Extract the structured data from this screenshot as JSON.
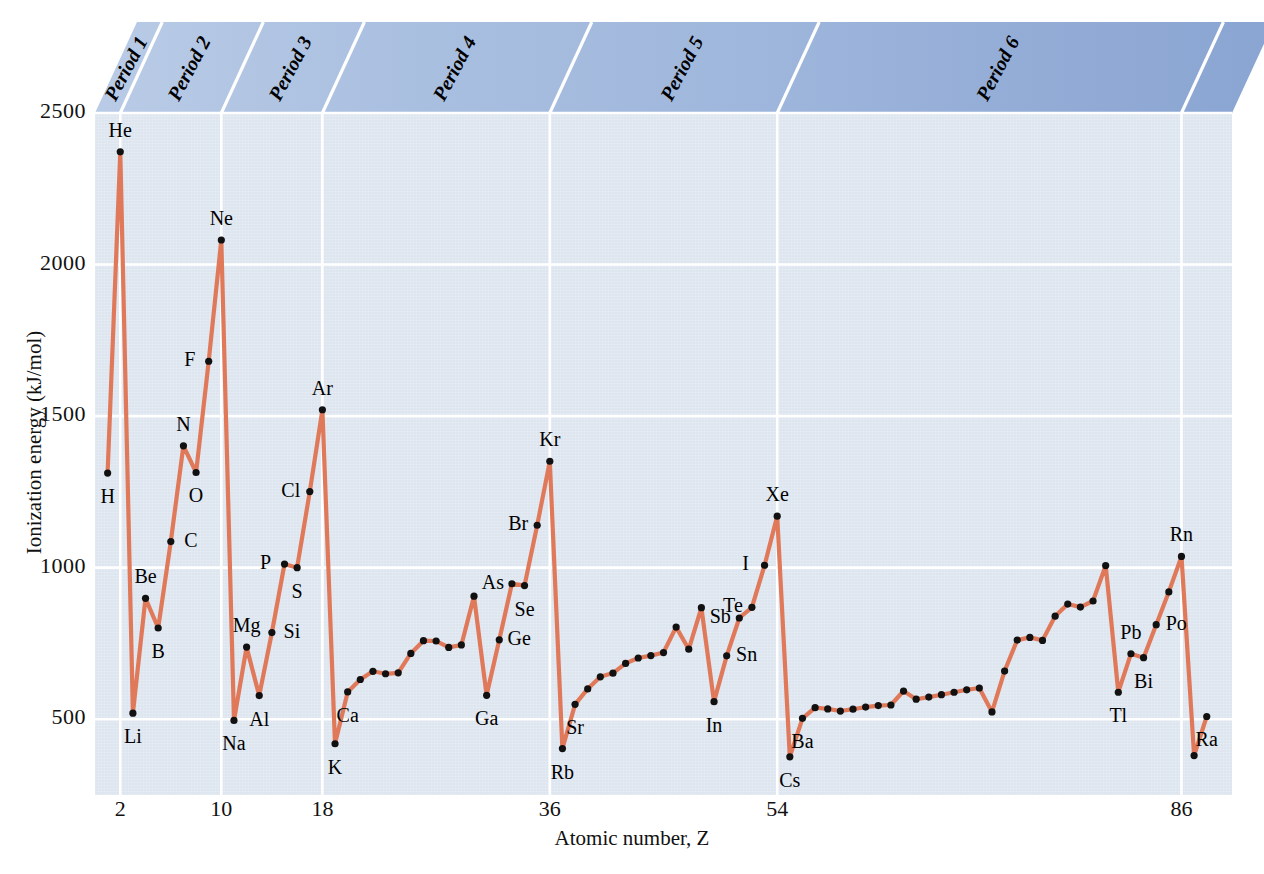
{
  "figure": {
    "axis_title_x": "Atomic number, Z",
    "axis_title_y": "Ionization energy (kJ/mol)"
  },
  "periods": [
    {
      "label": "Period 1",
      "z_start": 1,
      "z_end": 2
    },
    {
      "label": "Period 2",
      "z_start": 3,
      "z_end": 10
    },
    {
      "label": "Period 3",
      "z_start": 11,
      "z_end": 18
    },
    {
      "label": "Period 4",
      "z_start": 19,
      "z_end": 36
    },
    {
      "label": "Period 5",
      "z_start": 37,
      "z_end": 54
    },
    {
      "label": "Period 6",
      "z_start": 55,
      "z_end": 86
    }
  ],
  "colors": {
    "line": "#e0795a",
    "marker": "#111111",
    "plot_background": "#dde5ef",
    "gridline": "#ffffff",
    "band_light": "#aec3e0",
    "band_dark": "#8aa8d0"
  },
  "chart_data": {
    "type": "line",
    "title": "",
    "xlabel": "Atomic number, Z",
    "ylabel": "Ionization energy (kJ/mol)",
    "xlim": [
      0,
      90
    ],
    "ylim": [
      250,
      2500
    ],
    "xticks": [
      2,
      10,
      18,
      36,
      54,
      86
    ],
    "yticks": [
      500,
      1000,
      1500,
      2000,
      2500
    ],
    "grid": true,
    "legend": "none",
    "x": [
      1,
      2,
      3,
      4,
      5,
      6,
      7,
      8,
      9,
      10,
      11,
      12,
      13,
      14,
      15,
      16,
      17,
      18,
      19,
      20,
      21,
      22,
      23,
      24,
      25,
      26,
      27,
      28,
      29,
      30,
      31,
      32,
      33,
      34,
      35,
      36,
      37,
      38,
      39,
      40,
      41,
      42,
      43,
      44,
      45,
      46,
      47,
      48,
      49,
      50,
      51,
      52,
      53,
      54,
      55,
      56,
      57,
      58,
      59,
      60,
      61,
      62,
      63,
      64,
      65,
      66,
      67,
      68,
      69,
      70,
      71,
      72,
      73,
      74,
      75,
      76,
      77,
      78,
      79,
      80,
      81,
      82,
      83,
      84,
      85,
      86,
      87,
      88
    ],
    "values": [
      1312,
      2372,
      520,
      899,
      801,
      1086,
      1402,
      1314,
      1681,
      2081,
      496,
      738,
      578,
      786,
      1012,
      1000,
      1251,
      1521,
      419,
      590,
      631,
      658,
      650,
      653,
      717,
      759,
      758,
      737,
      745,
      906,
      579,
      762,
      947,
      941,
      1140,
      1351,
      403,
      549,
      600,
      640,
      652,
      684,
      702,
      710,
      720,
      804,
      731,
      868,
      558,
      709,
      834,
      869,
      1008,
      1170,
      376,
      503,
      538,
      534,
      527,
      533,
      540,
      545,
      547,
      593,
      566,
      573,
      581,
      589,
      597,
      603,
      524,
      659,
      761,
      770,
      760,
      840,
      880,
      870,
      890,
      1007,
      589,
      716,
      703,
      812,
      920,
      1037,
      380,
      509
    ],
    "labeled_points": [
      {
        "z": 1,
        "label": "H",
        "value": 1312,
        "pos": "below"
      },
      {
        "z": 2,
        "label": "He",
        "value": 2372,
        "pos": "above"
      },
      {
        "z": 3,
        "label": "Li",
        "value": 520,
        "pos": "below"
      },
      {
        "z": 4,
        "label": "Be",
        "value": 899,
        "pos": "above"
      },
      {
        "z": 5,
        "label": "B",
        "value": 801,
        "pos": "below"
      },
      {
        "z": 6,
        "label": "C",
        "value": 1086,
        "pos": "right"
      },
      {
        "z": 7,
        "label": "N",
        "value": 1402,
        "pos": "above"
      },
      {
        "z": 8,
        "label": "O",
        "value": 1314,
        "pos": "below"
      },
      {
        "z": 9,
        "label": "F",
        "value": 1681,
        "pos": "left"
      },
      {
        "z": 10,
        "label": "Ne",
        "value": 2081,
        "pos": "above"
      },
      {
        "z": 11,
        "label": "Na",
        "value": 496,
        "pos": "below"
      },
      {
        "z": 12,
        "label": "Mg",
        "value": 738,
        "pos": "above"
      },
      {
        "z": 13,
        "label": "Al",
        "value": 578,
        "pos": "below"
      },
      {
        "z": 14,
        "label": "Si",
        "value": 786,
        "pos": "right"
      },
      {
        "z": 15,
        "label": "P",
        "value": 1012,
        "pos": "left"
      },
      {
        "z": 16,
        "label": "S",
        "value": 1000,
        "pos": "below"
      },
      {
        "z": 17,
        "label": "Cl",
        "value": 1251,
        "pos": "left"
      },
      {
        "z": 18,
        "label": "Ar",
        "value": 1521,
        "pos": "above"
      },
      {
        "z": 19,
        "label": "K",
        "value": 419,
        "pos": "below"
      },
      {
        "z": 20,
        "label": "Ca",
        "value": 590,
        "pos": "below"
      },
      {
        "z": 31,
        "label": "Ga",
        "value": 579,
        "pos": "below"
      },
      {
        "z": 32,
        "label": "Ge",
        "value": 762,
        "pos": "right"
      },
      {
        "z": 33,
        "label": "As",
        "value": 947,
        "pos": "left"
      },
      {
        "z": 34,
        "label": "Se",
        "value": 941,
        "pos": "below"
      },
      {
        "z": 35,
        "label": "Br",
        "value": 1140,
        "pos": "left"
      },
      {
        "z": 36,
        "label": "Kr",
        "value": 1351,
        "pos": "above"
      },
      {
        "z": 37,
        "label": "Rb",
        "value": 403,
        "pos": "below"
      },
      {
        "z": 38,
        "label": "Sr",
        "value": 549,
        "pos": "below"
      },
      {
        "z": 49,
        "label": "In",
        "value": 558,
        "pos": "below"
      },
      {
        "z": 50,
        "label": "Sn",
        "value": 709,
        "pos": "right"
      },
      {
        "z": 51,
        "label": "Sb",
        "value": 834,
        "pos": "left"
      },
      {
        "z": 52,
        "label": "Te",
        "value": 869,
        "pos": "left"
      },
      {
        "z": 53,
        "label": "I",
        "value": 1008,
        "pos": "left"
      },
      {
        "z": 54,
        "label": "Xe",
        "value": 1170,
        "pos": "above"
      },
      {
        "z": 55,
        "label": "Cs",
        "value": 376,
        "pos": "below"
      },
      {
        "z": 56,
        "label": "Ba",
        "value": 503,
        "pos": "below"
      },
      {
        "z": 81,
        "label": "Tl",
        "value": 589,
        "pos": "below"
      },
      {
        "z": 82,
        "label": "Pb",
        "value": 716,
        "pos": "above"
      },
      {
        "z": 83,
        "label": "Bi",
        "value": 703,
        "pos": "below"
      },
      {
        "z": 84,
        "label": "Po",
        "value": 812,
        "pos": "right"
      },
      {
        "z": 86,
        "label": "Rn",
        "value": 1037,
        "pos": "above"
      },
      {
        "z": 88,
        "label": "Ra",
        "value": 509,
        "pos": "below"
      }
    ]
  }
}
